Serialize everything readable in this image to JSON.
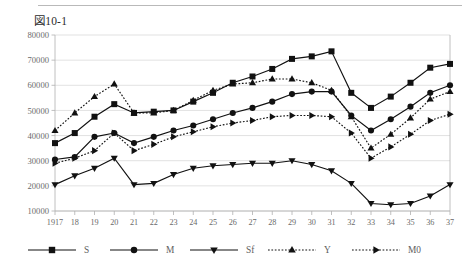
{
  "figure": {
    "title": "図10-1",
    "has_top_rule": true
  },
  "chart_data": {
    "type": "line",
    "title": "図10-1",
    "xlabel": "",
    "ylabel": "",
    "grid": true,
    "legend_position": "bottom",
    "xlim": [
      1917,
      1937
    ],
    "ylim": [
      10000,
      80000
    ],
    "ytick_values": [
      10000,
      20000,
      30000,
      40000,
      50000,
      60000,
      70000,
      80000
    ],
    "ytick_labels": [
      "10000",
      "20000",
      "30000",
      "40000",
      "50000",
      "60000",
      "70000",
      "80000"
    ],
    "x": [
      1917,
      1918,
      1919,
      1920,
      1921,
      1922,
      1923,
      1924,
      1925,
      1926,
      1927,
      1928,
      1929,
      1930,
      1931,
      1932,
      1933,
      1934,
      1935,
      1936,
      1937
    ],
    "xtick_labels": [
      "1917",
      "18",
      "19",
      "20",
      "21",
      "22",
      "23",
      "24",
      "25",
      "26",
      "27",
      "28",
      "29",
      "30",
      "31",
      "32",
      "33",
      "34",
      "35",
      "36",
      "37"
    ],
    "series": [
      {
        "name": "S",
        "marker": "square",
        "linestyle": "solid",
        "color": "#111111",
        "values": [
          37000,
          41000,
          47500,
          52500,
          49000,
          49500,
          50000,
          53500,
          57000,
          61000,
          63500,
          66500,
          70500,
          71500,
          73500,
          57000,
          51000,
          55500,
          61000,
          67000,
          68500
        ]
      },
      {
        "name": "M",
        "marker": "circle",
        "linestyle": "solid",
        "color": "#111111",
        "values": [
          30500,
          31500,
          39500,
          41000,
          37000,
          39500,
          42000,
          44000,
          46500,
          49000,
          51000,
          53500,
          56500,
          57500,
          57500,
          48000,
          42000,
          46500,
          51500,
          57000,
          60000
        ]
      },
      {
        "name": "Sf",
        "marker": "down-triangle",
        "linestyle": "solid",
        "color": "#111111",
        "values": [
          20500,
          24000,
          27000,
          31000,
          20500,
          21000,
          24500,
          27000,
          28000,
          28500,
          29000,
          29000,
          30000,
          28500,
          26000,
          21000,
          13000,
          12500,
          13000,
          16000,
          20500
        ]
      },
      {
        "name": "Y",
        "marker": "up-triangle",
        "linestyle": "dotted",
        "color": "#111111",
        "values": [
          42000,
          49000,
          55500,
          60500,
          49000,
          49000,
          50000,
          54000,
          58000,
          60500,
          61000,
          62500,
          62500,
          61000,
          58000,
          47500,
          35000,
          40500,
          47000,
          54500,
          57500
        ]
      },
      {
        "name": "M0",
        "marker": "right-triangle",
        "linestyle": "dotted",
        "color": "#111111",
        "values": [
          29000,
          31000,
          34000,
          41000,
          34000,
          36500,
          39500,
          41500,
          43500,
          45000,
          46000,
          47500,
          48000,
          48000,
          47500,
          41000,
          31000,
          35500,
          40500,
          46000,
          48500
        ]
      }
    ]
  },
  "legend": {
    "items": [
      {
        "label": "S",
        "marker": "square",
        "linestyle": "solid"
      },
      {
        "label": "M",
        "marker": "circle",
        "linestyle": "solid"
      },
      {
        "label": "Sf",
        "marker": "down-triangle",
        "linestyle": "solid"
      },
      {
        "label": "Y",
        "marker": "up-triangle",
        "linestyle": "dotted"
      },
      {
        "label": "M0",
        "marker": "right-triangle",
        "linestyle": "dotted"
      }
    ]
  }
}
